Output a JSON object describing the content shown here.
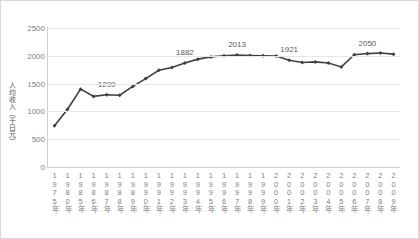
{
  "chart_data": {
    "type": "line",
    "title": "",
    "xlabel": "",
    "ylabel": "人均收入（千日元）",
    "ylim": [
      0,
      2500
    ],
    "yticks": [
      2500,
      2000,
      1500,
      1000,
      500,
      0
    ],
    "grid": true,
    "legend": "none",
    "series_color": "#404040",
    "marker": "diamond",
    "categories": [
      "1975年",
      "1980年",
      "1985年",
      "1986年",
      "1987年",
      "1988年",
      "1989年",
      "1990年",
      "1991年",
      "1992年",
      "1993年",
      "1994年",
      "1995年",
      "1996年",
      "1997年",
      "1998年",
      "1999年",
      "2000年",
      "2001年",
      "2002年",
      "2003年",
      "2004年",
      "2005年",
      "2006年",
      "2007年",
      "2008年",
      "2009年"
    ],
    "values": [
      740,
      1040,
      1400,
      1270,
      1299,
      1290,
      1450,
      1590,
      1740,
      1790,
      1870,
      1940,
      1980,
      2000,
      2013,
      2005,
      2000,
      1995,
      1921,
      1880,
      1890,
      1870,
      1800,
      2020,
      2040,
      2050,
      2030
    ],
    "point_labels": [
      {
        "category": "1987年",
        "value": 1299,
        "text": "1299"
      },
      {
        "category": "1993年",
        "value": 1870,
        "text": "1882"
      },
      {
        "category": "1997年",
        "value": 2013,
        "text": "2013"
      },
      {
        "category": "2001年",
        "value": 1921,
        "text": "1921"
      },
      {
        "category": "2007年",
        "value": 2040,
        "text": "2050"
      }
    ]
  }
}
